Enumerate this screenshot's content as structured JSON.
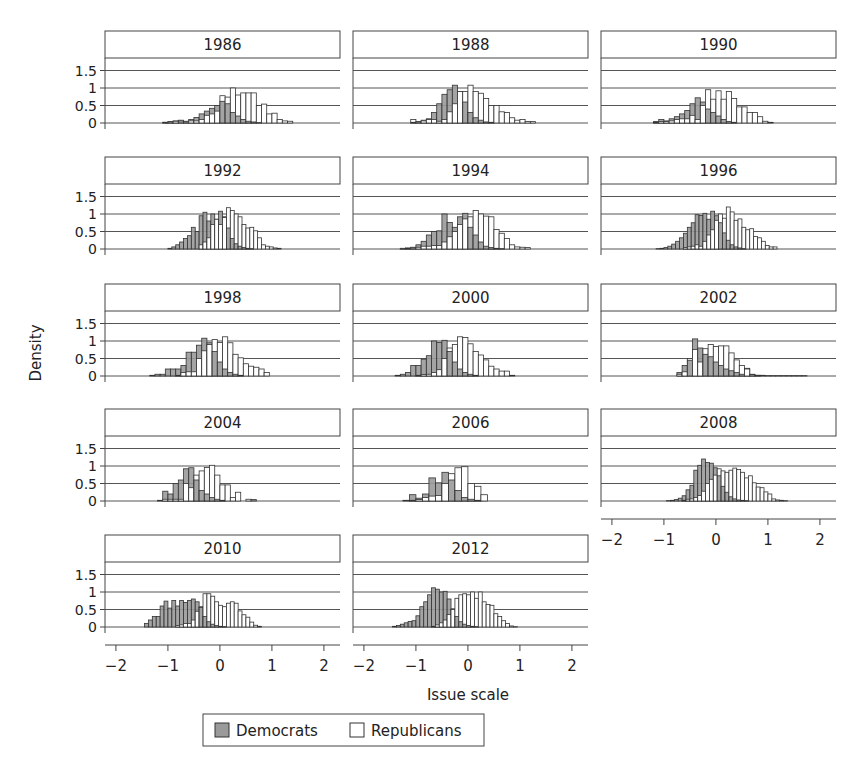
{
  "chart_data": {
    "type": "bar",
    "subtype": "faceted-overlaid-histogram",
    "title": "",
    "xlabel": "Issue scale",
    "ylabel": "Density",
    "xlim": [
      -2.21,
      2.31
    ],
    "ylim": [
      0,
      1.6
    ],
    "x_ticks": [
      -2,
      -1,
      0,
      1,
      2
    ],
    "y_ticks": [
      0,
      0.5,
      1,
      1.5
    ],
    "y_tick_labels": [
      "0",
      "0.5",
      "1",
      "1.5"
    ],
    "grid": "horizontal",
    "legend": {
      "position": "bottom",
      "entries": [
        {
          "label": "Democrats",
          "color": "#9a9a9a"
        },
        {
          "label": "Republicans",
          "color": "#ffffff"
        }
      ]
    },
    "colors": {
      "democrats": "#9a9a9a",
      "republicans": "#ffffff",
      "stroke": "#333333",
      "grid": "#555555"
    },
    "panels": [
      {
        "year": "1986",
        "binwidth": 0.1,
        "start": -1.1,
        "dem": [
          0.02,
          0.04,
          0.06,
          0.06,
          0.05,
          0.1,
          0.16,
          0.26,
          0.34,
          0.42,
          0.5,
          0.62,
          0.55,
          0.3,
          0.2,
          0.1,
          0.05,
          0.03,
          0.01,
          0,
          0,
          0,
          0,
          0
        ],
        "rep": [
          0.02,
          0.03,
          0.05,
          0.08,
          0.03,
          0.06,
          0.06,
          0.1,
          0.22,
          0.26,
          0.34,
          0.78,
          0.74,
          1.0,
          0.8,
          0.86,
          0.86,
          0.86,
          0.5,
          0.54,
          0.26,
          0.28,
          0.1,
          0.06,
          0.05
        ]
      },
      {
        "year": "1988",
        "binwidth": 0.1,
        "start": -1.1,
        "dem": [
          0.02,
          0.04,
          0.08,
          0.12,
          0.3,
          0.55,
          0.82,
          0.95,
          1.08,
          0.9,
          0.6,
          0.3,
          0.15,
          0.08,
          0.03,
          0.02,
          0,
          0,
          0,
          0,
          0,
          0,
          0,
          0
        ],
        "rep": [
          0.1,
          0.03,
          0.06,
          0.1,
          0.1,
          0.05,
          0.1,
          0.32,
          0.55,
          0.9,
          0.9,
          1.08,
          0.9,
          0.85,
          0.7,
          0.5,
          0.5,
          0.32,
          0.3,
          0.15,
          0.08,
          0.1,
          0.04,
          0.04
        ]
      },
      {
        "year": "1990",
        "binwidth": 0.1,
        "start": -1.2,
        "dem": [
          0.04,
          0.1,
          0.06,
          0.12,
          0.18,
          0.26,
          0.36,
          0.55,
          0.72,
          0.6,
          0.4,
          0.3,
          0.2,
          0.1,
          0.04,
          0.02,
          0,
          0,
          0,
          0,
          0,
          0,
          0,
          0
        ],
        "rep": [
          0.02,
          0.04,
          0.04,
          0.06,
          0.1,
          0.12,
          0.12,
          0.22,
          0.1,
          0.5,
          0.95,
          0.68,
          0.92,
          0.68,
          0.9,
          0.7,
          0.46,
          0.46,
          0.3,
          0.3,
          0.18,
          0.05,
          0.02,
          0
        ]
      },
      {
        "year": "1992",
        "binwidth": 0.075,
        "start": -1.0,
        "dem": [
          0.02,
          0.06,
          0.12,
          0.2,
          0.3,
          0.38,
          0.62,
          0.5,
          0.95,
          1.05,
          0.8,
          1.0,
          0.85,
          1.08,
          0.92,
          0.6,
          0.3,
          0.15,
          0.08,
          0.04,
          0.02,
          0.01,
          0,
          0,
          0,
          0,
          0,
          0,
          0
        ],
        "rep": [
          0,
          0,
          0,
          0,
          0,
          0,
          0,
          0,
          0.12,
          0.2,
          0.32,
          0.7,
          0.85,
          0.7,
          0.9,
          1.18,
          1.1,
          1.0,
          0.92,
          0.7,
          0.6,
          0.62,
          0.52,
          0.32,
          0.12,
          0.08,
          0.06,
          0.03,
          0.02
        ]
      },
      {
        "year": "1994",
        "binwidth": 0.1,
        "start": -1.3,
        "dem": [
          0.02,
          0.03,
          0.05,
          0.12,
          0.22,
          0.4,
          0.5,
          0.52,
          1.0,
          0.76,
          0.62,
          0.92,
          1.02,
          0.62,
          0.4,
          0.2,
          0.08,
          0.04,
          0.02,
          0.01,
          0,
          0,
          0,
          0,
          0
        ],
        "rep": [
          0.01,
          0.02,
          0.03,
          0.05,
          0.08,
          0.08,
          0.1,
          0.1,
          0.2,
          0.35,
          0.5,
          0.7,
          0.86,
          0.92,
          1.1,
          1.0,
          0.94,
          0.92,
          0.56,
          0.45,
          0.3,
          0.12,
          0.06,
          0.05,
          0.04
        ]
      },
      {
        "year": "1996",
        "binwidth": 0.075,
        "start": -1.15,
        "dem": [
          0.01,
          0.02,
          0.04,
          0.08,
          0.14,
          0.22,
          0.32,
          0.45,
          0.62,
          0.75,
          0.98,
          0.96,
          1.02,
          0.85,
          1.08,
          0.95,
          0.75,
          0.46,
          0.25,
          0.12,
          0.06,
          0.03,
          0.01,
          0,
          0,
          0,
          0,
          0,
          0,
          0,
          0
        ],
        "rep": [
          0,
          0,
          0,
          0,
          0,
          0,
          0,
          0.04,
          0.06,
          0.08,
          0.12,
          0.08,
          0.22,
          0.4,
          0.55,
          0.82,
          1.0,
          0.88,
          1.2,
          1.06,
          0.82,
          0.86,
          0.62,
          0.55,
          0.58,
          0.36,
          0.32,
          0.22,
          0.1,
          0.06,
          0.06
        ]
      },
      {
        "year": "1998",
        "binwidth": 0.1,
        "start": -1.35,
        "dem": [
          0.02,
          0.05,
          0.05,
          0.2,
          0.2,
          0.2,
          0.3,
          0.68,
          0.68,
          0.88,
          1.08,
          0.95,
          0.7,
          0.4,
          0.2,
          0.1,
          0.05,
          0.02,
          0,
          0,
          0,
          0,
          0
        ],
        "rep": [
          0,
          0,
          0,
          0,
          0,
          0.02,
          0.1,
          0.12,
          0.12,
          0.5,
          0.72,
          0.9,
          1.04,
          0.96,
          1.12,
          0.95,
          0.62,
          0.52,
          0.35,
          0.28,
          0.25,
          0.2,
          0.1
        ]
      },
      {
        "year": "2000",
        "binwidth": 0.1,
        "start": -1.4,
        "dem": [
          0.02,
          0.05,
          0.1,
          0.3,
          0.3,
          0.48,
          0.58,
          1.0,
          0.96,
          1.02,
          0.7,
          0.4,
          0.2,
          0.1,
          0.05,
          0.02,
          0,
          0,
          0,
          0,
          0,
          0,
          0,
          0
        ],
        "rep": [
          0,
          0,
          0,
          0,
          0.02,
          0.04,
          0.05,
          0.1,
          0.18,
          0.5,
          0.8,
          0.9,
          1.12,
          1.1,
          0.92,
          0.7,
          0.6,
          0.46,
          0.28,
          0.2,
          0.14,
          0.14,
          0.02,
          0
        ]
      },
      {
        "year": "2002",
        "binwidth": 0.1,
        "start": -0.75,
        "dem": [
          0.1,
          0.3,
          0.45,
          1.06,
          0.8,
          0.62,
          0.55,
          0.4,
          0.3,
          0.2,
          0.15,
          0.1,
          0.05,
          0.22,
          0.04,
          0.02,
          0.02,
          0.01,
          0.01,
          0.01,
          0.01,
          0.01,
          0.01,
          0.01,
          0.01
        ],
        "rep": [
          0.05,
          0.12,
          0.5,
          0.76,
          0.4,
          0.78,
          0.9,
          0.84,
          0.86,
          0.86,
          0.66,
          0.46,
          0.3,
          0.2,
          0.05,
          0.02,
          0,
          0,
          0,
          0,
          0,
          0,
          0,
          0,
          0
        ]
      },
      {
        "year": "2004",
        "binwidth": 0.1,
        "start": -1.2,
        "dem": [
          0.02,
          0.28,
          0.2,
          0.5,
          0.6,
          0.92,
          0.95,
          0.6,
          0.3,
          0.2,
          0.1,
          0.05,
          0.02,
          0,
          0,
          0,
          0,
          0,
          0.04,
          0
        ],
        "rep": [
          0,
          0.05,
          0.05,
          0.05,
          0.05,
          0.5,
          0.38,
          0.74,
          0.86,
          0.96,
          1.02,
          0.74,
          0.46,
          0.46,
          0.1,
          0.25,
          0,
          0.05,
          0,
          0
        ]
      },
      {
        "year": "2006",
        "binwidth": 0.125,
        "start": -1.25,
        "dem": [
          0.02,
          0.18,
          0.08,
          0.2,
          0.66,
          0.52,
          0.82,
          0.6,
          0.3,
          0.1,
          0.05,
          0.02,
          0,
          0,
          0
        ],
        "rep": [
          0,
          0.02,
          0.04,
          0.1,
          0.14,
          0.16,
          0.5,
          0.78,
          0.95,
          0.98,
          0.5,
          0.42,
          0.18,
          0,
          0
        ]
      },
      {
        "year": "2008",
        "binwidth": 0.075,
        "start": -0.95,
        "dem": [
          0.01,
          0.02,
          0.04,
          0.08,
          0.15,
          0.32,
          0.45,
          0.88,
          1.02,
          1.2,
          1.1,
          1.08,
          0.95,
          0.72,
          0.42,
          0.25,
          0.12,
          0.06,
          0.03,
          0.02,
          0.01,
          0,
          0,
          0,
          0,
          0,
          0,
          0,
          0,
          0,
          0
        ],
        "rep": [
          0,
          0,
          0,
          0,
          0.02,
          0.05,
          0.06,
          0.1,
          0.16,
          0.28,
          0.5,
          0.62,
          0.74,
          0.92,
          0.86,
          0.82,
          0.88,
          0.94,
          0.9,
          0.82,
          0.66,
          0.72,
          0.52,
          0.4,
          0.38,
          0.26,
          0.2,
          0.06,
          0.03,
          0.02,
          0.01
        ]
      },
      {
        "year": "2010",
        "binwidth": 0.075,
        "start": -1.45,
        "dem": [
          0.1,
          0.2,
          0.3,
          0.3,
          0.6,
          0.74,
          0.54,
          0.76,
          0.6,
          0.76,
          0.7,
          0.76,
          0.8,
          0.72,
          0.56,
          0.3,
          0.15,
          0.08,
          0.04,
          0.02,
          0.01,
          0,
          0,
          0,
          0,
          0,
          0,
          0,
          0,
          0,
          0,
          0,
          0,
          0
        ],
        "rep": [
          0,
          0,
          0,
          0,
          0,
          0,
          0,
          0,
          0.04,
          0.06,
          0.1,
          0.1,
          0.2,
          0.45,
          0.58,
          0.95,
          0.95,
          0.88,
          0.72,
          0.62,
          0.58,
          0.68,
          0.72,
          0.68,
          0.46,
          0.35,
          0.28,
          0.14,
          0.05,
          0.02,
          0,
          0,
          0,
          0
        ]
      },
      {
        "year": "2012",
        "binwidth": 0.075,
        "start": -1.45,
        "dem": [
          0.02,
          0.04,
          0.08,
          0.12,
          0.16,
          0.18,
          0.32,
          0.58,
          0.72,
          0.92,
          1.12,
          1.08,
          1.0,
          1.02,
          0.8,
          0.52,
          0.3,
          0.15,
          0.08,
          0.04,
          0.02,
          0.01,
          0,
          0,
          0,
          0,
          0,
          0,
          0,
          0,
          0,
          0
        ],
        "rep": [
          0,
          0,
          0,
          0,
          0,
          0,
          0,
          0,
          0,
          0,
          0.02,
          0.06,
          0.12,
          0.2,
          0.36,
          0.5,
          0.82,
          0.92,
          0.95,
          0.92,
          1.0,
          0.82,
          1.0,
          0.72,
          0.64,
          0.62,
          0.38,
          0.3,
          0.18,
          0.1,
          0.03,
          0.01
        ]
      }
    ]
  },
  "axis": {
    "x_title": "Issue scale",
    "y_title": "Density"
  },
  "legend": {
    "democrats_label": "Democrats",
    "republicans_label": "Republicans"
  }
}
